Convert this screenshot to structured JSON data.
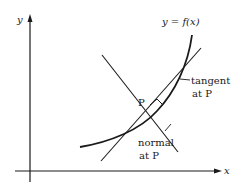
{
  "diagram": {
    "axes": {
      "x_label": "x",
      "y_label": "y"
    },
    "curve_label": "y = f(x)",
    "point_label": "P",
    "tangent_label_line1": "tangent",
    "tangent_label_line2": "at P",
    "normal_label_line1": "normal",
    "normal_label_line2": "at P",
    "colors": {
      "ink": "#1a1a1a",
      "background": "#ffffff"
    }
  }
}
